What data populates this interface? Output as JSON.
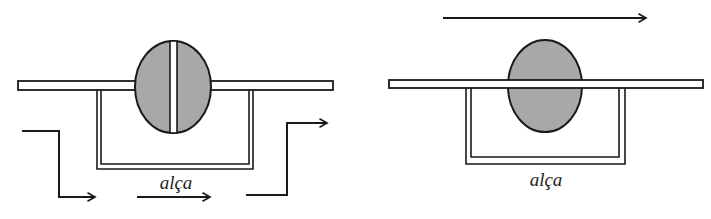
{
  "figure": {
    "colors": {
      "stroke": "#1a1a1a",
      "fill_gray": "#a8a8a8",
      "background": "#ffffff"
    },
    "panels": [
      {
        "id": "left",
        "description": "Rod passing through a split disc, with a loop (alça) below; flow arrows go down, across under the loop, and up",
        "loop_label": "alça",
        "elements": [
          "horizontal-rod",
          "split-disc",
          "loop",
          "flow-arrow-in",
          "flow-arrow-middle",
          "flow-arrow-out"
        ]
      },
      {
        "id": "right",
        "description": "Rod passing through a solid disc, with a loop (alça) below; single arrow above pointing right",
        "loop_label": "alça",
        "elements": [
          "direction-arrow-top",
          "horizontal-rod",
          "disc",
          "loop"
        ]
      }
    ]
  }
}
